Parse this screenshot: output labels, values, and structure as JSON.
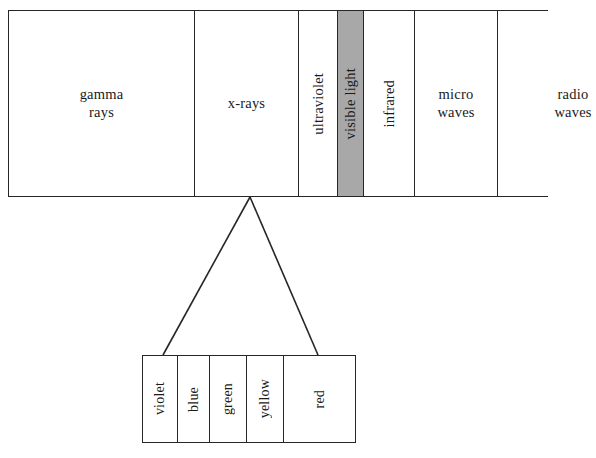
{
  "figure": {
    "colors": {
      "highlight": "#a8a8a8",
      "stroke": "#262626",
      "background": "#ffffff"
    }
  },
  "spectrum": {
    "bands": [
      {
        "label": "gamma\nrays",
        "orientation": "horizontal",
        "highlighted": false,
        "width_px": 186
      },
      {
        "label": "x-rays",
        "orientation": "horizontal",
        "highlighted": false,
        "width_px": 104
      },
      {
        "label": "ultraviolet",
        "orientation": "vertical",
        "highlighted": false,
        "width_px": 39
      },
      {
        "label": "visible light",
        "orientation": "vertical",
        "highlighted": true,
        "width_px": 26
      },
      {
        "label": "infrared",
        "orientation": "vertical",
        "highlighted": false,
        "width_px": 51
      },
      {
        "label": "micro\nwaves",
        "orientation": "horizontal",
        "highlighted": false,
        "width_px": 83
      },
      {
        "label": "radio\nwaves",
        "orientation": "horizontal",
        "highlighted": false,
        "width_px": 150
      }
    ]
  },
  "visible_light": {
    "segments": [
      {
        "label": "violet",
        "width_px": 35
      },
      {
        "label": "blue",
        "width_px": 32
      },
      {
        "label": "green",
        "width_px": 37
      },
      {
        "label": "yellow",
        "width_px": 37
      },
      {
        "label": "red",
        "width_px": 71
      }
    ]
  },
  "connectors": {
    "apex_x": 250,
    "apex_y": 197,
    "left_x": 163,
    "right_x": 318,
    "base_y": 355
  }
}
